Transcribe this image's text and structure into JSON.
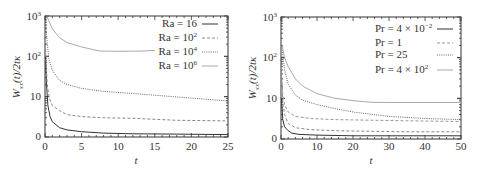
{
  "chart_data": [
    {
      "type": "line",
      "panel": "left",
      "title": "",
      "xlabel": "t",
      "ylabel": "W_xx(t)/2tκ",
      "xlim": [
        0,
        25
      ],
      "ylim_labels": [
        "0",
        "10",
        "10²",
        "10³"
      ],
      "yscale": "log",
      "x_ticks": [
        "0",
        "5",
        "10",
        "15",
        "20",
        "25"
      ],
      "legend_position": "upper right",
      "series": [
        {
          "name": "Ra = 16",
          "style": "solid",
          "color": "#333333",
          "x": [
            0.05,
            0.2,
            0.4,
            0.7,
            1,
            2,
            3,
            5,
            8,
            12,
            18,
            25
          ],
          "y": [
            100,
            20,
            6,
            3.2,
            2.4,
            1.7,
            1.5,
            1.35,
            1.25,
            1.2,
            1.18,
            1.15
          ]
        },
        {
          "name": "Ra = 10²",
          "style": "dashed",
          "color": "#888888",
          "x": [
            0.05,
            0.3,
            0.6,
            1,
            2,
            3,
            5,
            8,
            12,
            18,
            25
          ],
          "y": [
            150,
            20,
            9,
            6,
            4.5,
            3.6,
            3.2,
            3.0,
            2.9,
            2.6,
            2.5
          ]
        },
        {
          "name": "Ra = 10⁴",
          "style": "dotted",
          "color": "#666666",
          "x": [
            0.1,
            0.5,
            1,
            2,
            3,
            5,
            8,
            12,
            16,
            20,
            25
          ],
          "y": [
            600,
            90,
            45,
            25,
            20,
            16,
            13.5,
            12,
            10.5,
            9.2,
            7.8
          ]
        },
        {
          "name": "Ra = 10⁶",
          "style": "solid",
          "color": "#aaaaaa",
          "x": [
            0.3,
            1,
            2,
            3,
            5,
            7.5,
            10,
            13,
            15
          ],
          "y": [
            950,
            480,
            290,
            220,
            170,
            135,
            133,
            135,
            140
          ]
        }
      ]
    },
    {
      "type": "line",
      "panel": "right",
      "title": "",
      "xlabel": "t",
      "ylabel": "W_xx(t)/2tκ",
      "xlim": [
        0,
        50
      ],
      "ylim_labels": [
        "0",
        "10",
        "10²",
        "10³"
      ],
      "yscale": "log",
      "x_ticks": [
        "0",
        "10",
        "20",
        "30",
        "40",
        "50"
      ],
      "legend_position": "upper right",
      "series": [
        {
          "name": "Pr = 4 × 10⁻²",
          "style": "solid",
          "color": "#333333",
          "x": [
            0.1,
            0.5,
            1,
            2,
            3,
            5,
            10,
            20,
            30,
            40,
            50
          ],
          "y": [
            10,
            3,
            2,
            1.6,
            1.4,
            1.3,
            1.25,
            1.2,
            1.2,
            1.2,
            1.2
          ]
        },
        {
          "name": "Pr = 1",
          "style": "dashed",
          "color": "#888888",
          "x": [
            0.1,
            0.5,
            1,
            2,
            4,
            8,
            15,
            25,
            35,
            50
          ],
          "y": [
            40,
            8,
            4,
            2.4,
            1.9,
            1.7,
            1.6,
            1.55,
            1.5,
            1.5
          ]
        },
        {
          "name": "Pr = 25",
          "style": "dashed",
          "color": "#999999",
          "x": [
            0.1,
            0.5,
            1,
            2,
            4,
            8,
            15,
            25,
            35,
            50
          ],
          "y": [
            60,
            12,
            7,
            4.6,
            3.6,
            3.2,
            3.0,
            2.9,
            2.8,
            2.7
          ]
        },
        {
          "name": "Pr = 25 (dotted)",
          "style": "dotted",
          "color": "#666666",
          "x": [
            0.2,
            1,
            2,
            4,
            6,
            10,
            15,
            20,
            30,
            40,
            50
          ],
          "y": [
            200,
            50,
            22,
            12,
            9,
            7,
            5.6,
            4.6,
            3.6,
            3.2,
            3.0
          ]
        },
        {
          "name": "Pr = 4 × 10²",
          "style": "solid",
          "color": "#aaaaaa",
          "x": [
            0.3,
            1,
            2,
            4,
            6,
            10,
            15,
            20,
            25,
            30,
            40,
            50
          ],
          "y": [
            200,
            100,
            60,
            30,
            20,
            13,
            10,
            8.8,
            8,
            7.9,
            7.9,
            7.9
          ]
        }
      ]
    }
  ],
  "left": {
    "y_ticks": [
      {
        "label": "0",
        "sup": ""
      },
      {
        "label": "10",
        "sup": ""
      },
      {
        "label": "10",
        "sup": "2"
      },
      {
        "label": "10",
        "sup": "3"
      }
    ],
    "x_ticks": [
      "0",
      "5",
      "10",
      "15",
      "20",
      "25"
    ],
    "xlabel": "t",
    "ylabel_main": "W",
    "ylabel_sub": "xx",
    "ylabel_rest": "(t)/2tκ",
    "legend": [
      {
        "prefix": "Ra = ",
        "base": "16",
        "sup": ""
      },
      {
        "prefix": "Ra = ",
        "base": "10",
        "sup": "2"
      },
      {
        "prefix": "Ra = ",
        "base": "10",
        "sup": "4"
      },
      {
        "prefix": "Ra = ",
        "base": "10",
        "sup": "6"
      }
    ]
  },
  "right": {
    "y_ticks": [
      {
        "label": "0",
        "sup": ""
      },
      {
        "label": "10",
        "sup": ""
      },
      {
        "label": "10",
        "sup": "2"
      },
      {
        "label": "10",
        "sup": "3"
      }
    ],
    "x_ticks": [
      "0",
      "10",
      "20",
      "30",
      "40",
      "50"
    ],
    "xlabel": "t",
    "ylabel_main": "W",
    "ylabel_sub": "xx",
    "ylabel_rest": "(t)/2tκ",
    "legend": [
      {
        "prefix": "Pr = ",
        "base": "4 × 10",
        "sup": "−2"
      },
      {
        "prefix": "Pr = ",
        "base": "1",
        "sup": ""
      },
      {
        "prefix": "Pr = ",
        "base": "25",
        "sup": ""
      },
      {
        "prefix": "Pr = ",
        "base": "4 × 10",
        "sup": "2"
      }
    ]
  }
}
